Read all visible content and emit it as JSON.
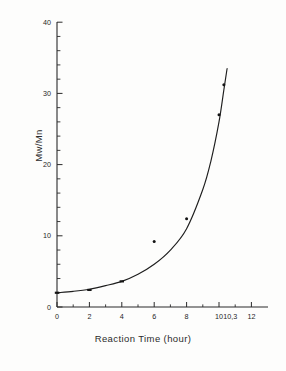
{
  "figure": {
    "caption_present": false,
    "background_color": "#fdfdfc",
    "ink_color": "#1e1e1e"
  },
  "chart_data": {
    "type": "scatter",
    "title": "",
    "subtitle": "",
    "xlabel": "Reaction Time  (hour)",
    "ylabel": "Mw/Mn",
    "xlim": [
      0,
      13
    ],
    "ylim": [
      0,
      42
    ],
    "grid": false,
    "legend": null,
    "x_major_ticks": [
      0,
      2,
      4,
      6,
      8,
      10,
      12
    ],
    "x_tick_labels": [
      "0",
      "2",
      "4",
      "6",
      "8",
      "10",
      "12"
    ],
    "x_extra_tick": 10.3,
    "x_extra_tick_label": "10,3",
    "y_major_ticks": [
      0,
      10,
      20,
      30,
      40
    ],
    "y_tick_labels": [
      "0",
      "10",
      "20",
      "30",
      "40"
    ],
    "y_minor_tick_interval": 2,
    "x_minor_tick_interval": 1,
    "series": [
      {
        "name": "Mw/Mn vs Reaction Time",
        "marker": "square-dot",
        "x": [
          0,
          2,
          4,
          6,
          8,
          10,
          10.3
        ],
        "values": [
          2.0,
          2.4,
          3.6,
          9.2,
          12.4,
          27.0,
          31.2
        ]
      }
    ],
    "fit_curve": {
      "name": "fitted exponential trend",
      "x": [
        0,
        1,
        2,
        3,
        4,
        5,
        6,
        7,
        8,
        9,
        9.5,
        10,
        10.3,
        10.5
      ],
      "values": [
        2.0,
        2.2,
        2.5,
        3.0,
        3.6,
        4.6,
        6.0,
        8.0,
        11.0,
        16.5,
        20.5,
        26.0,
        30.5,
        33.5
      ]
    },
    "annotations": []
  },
  "axes": {
    "x_axis_name": "Reaction Time  (hour)",
    "y_axis_name": "Mw/Mn"
  }
}
